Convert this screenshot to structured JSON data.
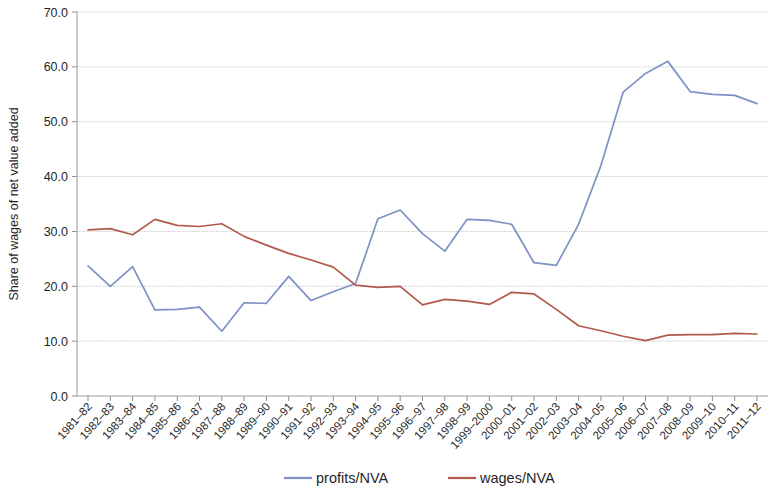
{
  "chart_data": {
    "type": "line",
    "title": "",
    "xlabel": "",
    "ylabel": "Share of wages of net value added",
    "ylim": [
      0.0,
      70.0
    ],
    "ytick_step": 10.0,
    "ytick_labels": [
      "0.0",
      "10.0",
      "20.0",
      "30.0",
      "40.0",
      "50.0",
      "60.0",
      "70.0"
    ],
    "grid": true,
    "legend_position": "bottom",
    "categories": [
      "1981–82",
      "1982–83",
      "1983–84",
      "1984–85",
      "1985–86",
      "1986–87",
      "1987–88",
      "1988–89",
      "1989–90",
      "1990–91",
      "1991–92",
      "1992–93",
      "1993–94",
      "1994–95",
      "1995–96",
      "1996–97",
      "1997–98",
      "1998–99",
      "1999–2000",
      "2000–01",
      "2001–02",
      "2002–03",
      "2003–04",
      "2004–05",
      "2005–06",
      "2006–07",
      "2007–08",
      "2008–09",
      "2009–10",
      "2010–11",
      "2011–12"
    ],
    "series": [
      {
        "name": "profits/NVA",
        "color": "#7e91c6",
        "values": [
          23.7,
          20.0,
          23.6,
          15.7,
          15.8,
          16.2,
          11.8,
          17.0,
          16.9,
          21.8,
          17.4,
          19.0,
          20.5,
          32.3,
          33.9,
          29.6,
          26.4,
          32.2,
          32.0,
          31.3,
          24.3,
          23.8,
          31.3,
          42.0,
          55.4,
          58.8,
          61.0,
          55.5,
          55.0,
          54.8,
          53.3
        ]
      },
      {
        "name": "wages/NVA",
        "color": "#b1594c",
        "values": [
          30.3,
          30.5,
          29.4,
          32.2,
          31.1,
          30.9,
          31.4,
          29.1,
          27.5,
          26.0,
          24.8,
          23.5,
          20.2,
          19.8,
          20.0,
          16.6,
          17.6,
          17.3,
          16.7,
          18.9,
          18.6,
          15.8,
          12.8,
          11.9,
          10.9,
          10.1,
          11.1,
          11.2,
          11.2,
          11.4,
          11.3
        ]
      }
    ],
    "legend": [
      {
        "label": "profits/NVA",
        "color": "#7e91c6"
      },
      {
        "label": "wages/NVA",
        "color": "#b1594c"
      }
    ]
  },
  "layout": {
    "plot_left": 77,
    "plot_right": 768,
    "plot_top": 12,
    "plot_bottom": 396,
    "legend_y": 478,
    "legend_profits_x": 284,
    "legend_wages_x": 448
  }
}
